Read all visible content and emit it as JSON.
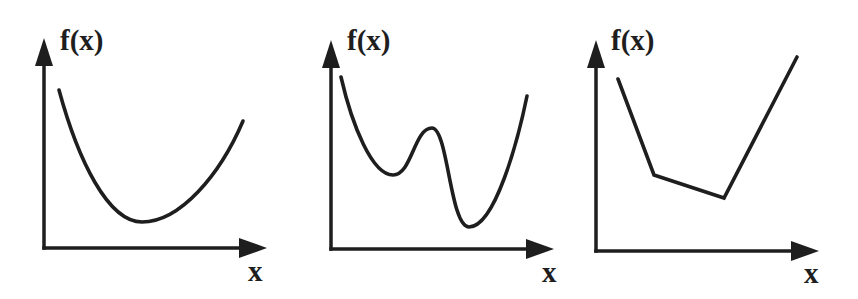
{
  "figure": {
    "ink_color": "#1e1e1e",
    "background_color": "#ffffff"
  },
  "panels": [
    {
      "id": "convex-smooth",
      "ylabel": "f(x)",
      "xlabel": "x",
      "curve_type": "smooth",
      "description": "Smooth convex curve with a single global minimum"
    },
    {
      "id": "non-convex",
      "ylabel": "f(x)",
      "xlabel": "x",
      "curve_type": "smooth",
      "description": "Non-convex curve with a local minimum, a local maximum, and a global minimum"
    },
    {
      "id": "convex-piecewise-linear",
      "ylabel": "f(x)",
      "xlabel": "x",
      "curve_type": "piecewise-linear",
      "description": "Convex piecewise-linear function with three segments"
    }
  ]
}
